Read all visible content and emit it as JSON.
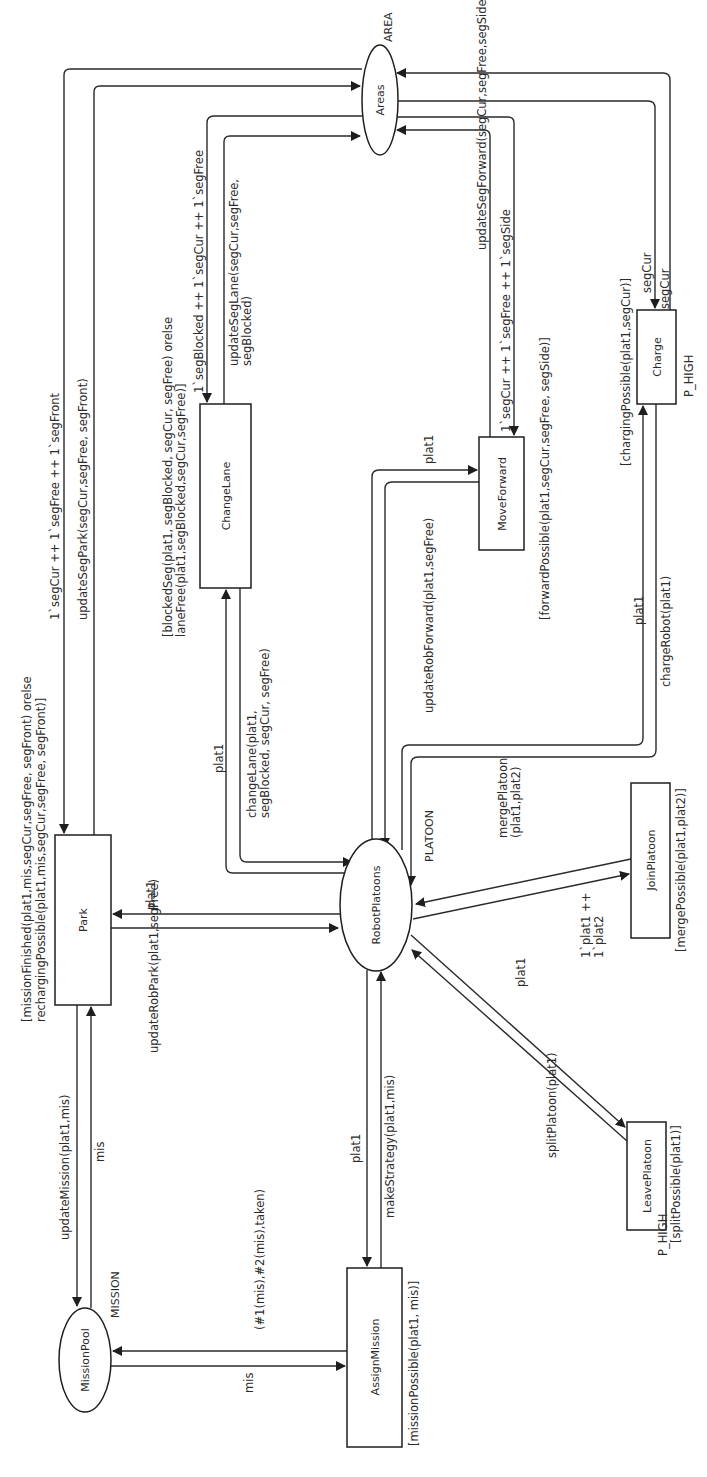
{
  "diagram": {
    "type": "Coloured Petri Net",
    "places": {
      "areas": {
        "name": "Areas",
        "colorset": "AREA"
      },
      "robot_platoons": {
        "name": "RobotPlatoons",
        "colorset": "PLATOON"
      },
      "mission_pool": {
        "name": "MissionPool",
        "colorset": "MISSION"
      }
    },
    "transitions": {
      "park": {
        "name": "Park",
        "guard_line1": "[missionFinished(plat1,mis,segCur,segFree, segFront) orelse",
        "guard_line2": "rechargingPossible(plat1,mis,segCur,segFree, segFront)]"
      },
      "change_lane": {
        "name": "ChangeLane",
        "guard_line1": "[blockedSeg(plat1, segBlocked, segCur, segFree) orelse",
        "guard_line2": "laneFree(plat1,segBlocked,segCur,segFree)]"
      },
      "move_forward": {
        "name": "MoveForward",
        "guard": "[forwardPossible(plat1,segCur,segFree, segSide)]"
      },
      "charge": {
        "name": "Charge",
        "guard": "[chargingPossible(plat1,segCur)]",
        "priority": "P_HIGH"
      },
      "join_platoon": {
        "name": "JoinPlatoon",
        "guard": "[mergePossible(plat1,plat2)]"
      },
      "leave_platoon": {
        "name": "LeavePlatoon",
        "guard": "[splitPossible(plat1)]",
        "priority": "P_HIGH"
      },
      "assign_mission": {
        "name": "AssignMission",
        "guard": "[missionPossible(plat1, mis)]"
      }
    },
    "arcs": {
      "areas_to_park": "1`segCur ++ 1`segFree ++ 1`segFront",
      "park_to_areas": "updateSegPark(segCur,segFree, segFront)",
      "areas_to_changelane": "1`segBlocked ++ 1`segCur ++ 1`segFree",
      "changelane_to_areas_line1": "updateSegLane(segCur,segFree,",
      "changelane_to_areas_line2": "segBlocked)",
      "areas_to_moveforward": "1`segCur ++ 1`segFree ++ 1`segSide",
      "moveforward_to_areas": "updateSegForward(segCur,segFree,segSide)",
      "areas_to_charge": "segCur",
      "charge_to_areas": "segCur",
      "rp_to_changelane": "plat1",
      "changelane_to_rp_line1": "changeLane(plat1,",
      "changelane_to_rp_line2": "segBlocked, segCur, segFree)",
      "rp_to_moveforward": "plat1",
      "moveforward_to_rp": "updateRobForward(plat1,segFree)",
      "rp_to_charge": "plat1",
      "charge_to_rp": "chargeRobot(plat1)",
      "rp_to_park": "plat1",
      "park_to_rp": "updateRobPark(plat1,segFree)",
      "joinplatoon_to_rp_line1": "mergePlatoon",
      "joinplatoon_to_rp_line2": "(plat1,plat2)",
      "rp_to_joinplatoon_line1": "1`plat1 ++",
      "rp_to_joinplatoon_line2": "1`plat2",
      "rp_to_leaveplatoon": "plat1",
      "leaveplatoon_to_rp": "splitPlatoon(plat1)",
      "park_to_missionpool": "updateMission(plat1,mis)",
      "missionpool_to_park": "mis",
      "rp_to_assignmission": "plat1",
      "assignmission_to_rp": "makeStrategy(plat1,mis)",
      "missionpool_to_assignmission": "mis",
      "assignmission_to_missionpool": "(#1(mis),#2(mis),taken)"
    }
  }
}
